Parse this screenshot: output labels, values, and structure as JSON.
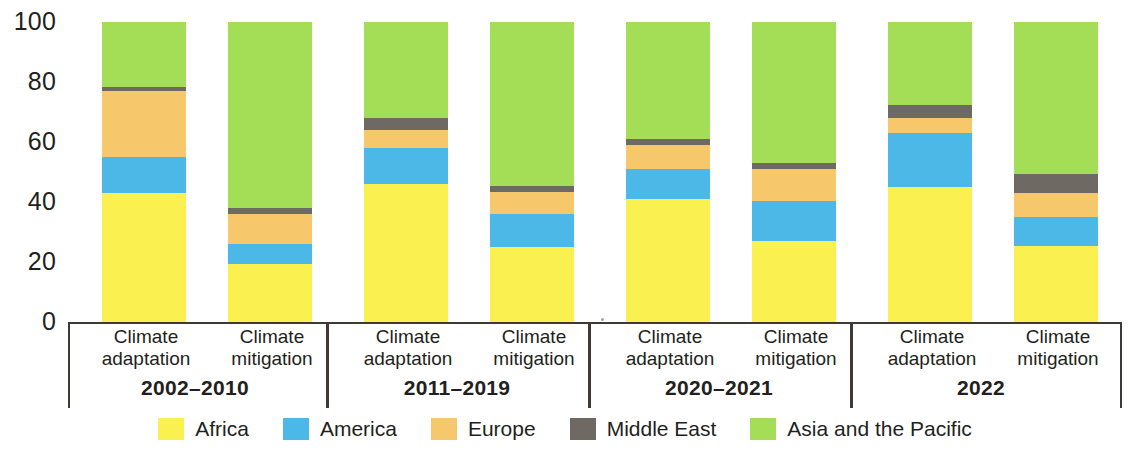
{
  "chart_data": {
    "type": "bar",
    "subtype": "stacked-100-percent",
    "title": "",
    "xlabel": "",
    "ylabel": "",
    "ylim": [
      0,
      100
    ],
    "yticks": [
      "0",
      "20",
      "40",
      "60",
      "80",
      "100"
    ],
    "ytick_values": [
      0,
      20,
      40,
      60,
      80,
      100
    ],
    "grid": false,
    "legend_position": "bottom",
    "stack_order_bottom_to_top": [
      "Africa",
      "America",
      "Europe",
      "Middle East",
      "Asia and the Pacific"
    ],
    "legend": [
      {
        "name": "Africa",
        "color": "#faf050"
      },
      {
        "name": "America",
        "color": "#4bb8e8"
      },
      {
        "name": "Europe",
        "color": "#f7c86b"
      },
      {
        "name": "Middle East",
        "color": "#6e6a63"
      },
      {
        "name": "Asia and the Pacific",
        "color": "#a3de56"
      }
    ],
    "groups": [
      {
        "period": "2002–2010",
        "bars": [
          {
            "label_line1": "Climate",
            "label_line2": "adaptation",
            "values": [
              43,
              12,
              22,
              1.5,
              21.5
            ]
          },
          {
            "label_line1": "Climate",
            "label_line2": "mitigation",
            "values": [
              19.5,
              6.5,
              10,
              2,
              62
            ]
          }
        ]
      },
      {
        "period": "2011–2019",
        "bars": [
          {
            "label_line1": "Climate",
            "label_line2": "adaptation",
            "values": [
              46,
              12,
              6,
              4,
              32
            ]
          },
          {
            "label_line1": "Climate",
            "label_line2": "mitigation",
            "values": [
              25,
              11,
              7.5,
              2,
              54.5
            ]
          }
        ]
      },
      {
        "period": "2020–2021",
        "bars": [
          {
            "label_line1": "Climate",
            "label_line2": "adaptation",
            "values": [
              41,
              10,
              8,
              2,
              39
            ]
          },
          {
            "label_line1": "Climate",
            "label_line2": "mitigation",
            "values": [
              27,
              13.5,
              10.5,
              2,
              47
            ]
          }
        ]
      },
      {
        "period": "2022",
        "bars": [
          {
            "label_line1": "Climate",
            "label_line2": "adaptation",
            "values": [
              45,
              18,
              5,
              4.5,
              27.5
            ]
          },
          {
            "label_line1": "Climate",
            "label_line2": "mitigation",
            "values": [
              25.5,
              9.5,
              8,
              6.5,
              50.5
            ]
          }
        ]
      }
    ]
  },
  "axis": {
    "y_tick_labels": [
      "100",
      "80",
      "60",
      "40",
      "20",
      "0"
    ]
  }
}
